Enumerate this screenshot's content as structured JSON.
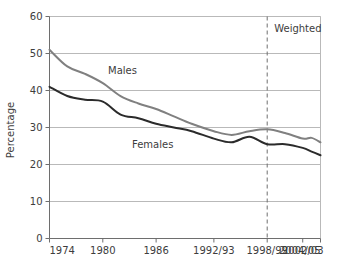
{
  "chart_data": {
    "type": "line",
    "title": "",
    "subtitle": "",
    "xlabel": "",
    "ylabel": "Percentage",
    "ylim": [
      0,
      60
    ],
    "ytick_labels": [
      "0",
      "10",
      "20",
      "30",
      "40",
      "50",
      "60"
    ],
    "ytick_values": [
      0,
      10,
      20,
      30,
      40,
      50,
      60
    ],
    "xtick_labels": [
      "1974",
      "1980",
      "1986",
      "1992/93",
      "1998/99",
      "2002/03",
      "2004/05"
    ],
    "xtick_values": [
      1974,
      1980,
      1986,
      1992.5,
      1998.5,
      2002.5,
      2004.5
    ],
    "xlim": [
      1974,
      2004.5
    ],
    "grid": "horizontal",
    "legend": "inline-labels",
    "series": [
      {
        "name": "Males",
        "color": "#808080",
        "label_text": "Males",
        "x": [
          1974,
          1976,
          1978,
          1980,
          1982,
          1984,
          1986,
          1988,
          1990,
          1992.5,
          1994.5,
          1996.5,
          1998.5,
          2000.5,
          2002.5,
          2003.5,
          2004.5
        ],
        "values": [
          51.0,
          46.5,
          44.5,
          42.0,
          38.5,
          36.5,
          35.0,
          33.0,
          31.0,
          29.0,
          28.0,
          29.0,
          29.5,
          28.5,
          27.0,
          27.2,
          26.0
        ]
      },
      {
        "name": "Females",
        "color": "#2b2b2b",
        "label_text": "Females",
        "x": [
          1974,
          1976,
          1978,
          1980,
          1982,
          1984,
          1986,
          1988,
          1990,
          1992.5,
          1994.5,
          1996.5,
          1998.5,
          2000.5,
          2002.5,
          2003.5,
          2004.5
        ],
        "values": [
          41.0,
          38.5,
          37.5,
          37.0,
          33.5,
          32.5,
          31.0,
          30.0,
          29.0,
          27.0,
          26.0,
          27.5,
          25.5,
          25.5,
          24.5,
          23.5,
          22.5
        ]
      }
    ],
    "annotations": [
      {
        "name": "weighted-marker",
        "text": "Weighted",
        "x": 1998.5,
        "style": "dashed-vertical-line"
      }
    ],
    "colors": {
      "males_line": "#808080",
      "females_line": "#2b2b2b",
      "gridline": "#b9b9b9",
      "axis": "#6e6e6e",
      "text": "#3d3d3d",
      "background": "#ffffff"
    }
  }
}
